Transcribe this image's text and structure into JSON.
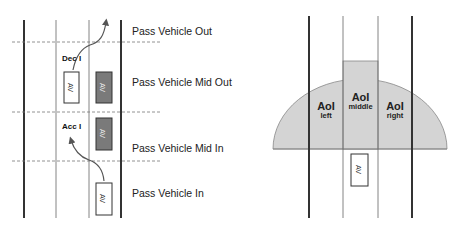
{
  "left_diagram": {
    "zone_labels": [
      "Pass Vehicle Out",
      "Pass Vehicle Mid Out",
      "Pass Vehicle Mid In",
      "Pass Vehicle In"
    ],
    "maneuvers": {
      "decel": "Dec I",
      "accel": "Acc I"
    },
    "vehicles": [
      {
        "label": "AV",
        "style": "white"
      },
      {
        "label": "AV",
        "style": "gray"
      },
      {
        "label": "AV",
        "style": "gray"
      },
      {
        "label": "AV",
        "style": "white"
      }
    ]
  },
  "right_diagram": {
    "aoi": [
      {
        "title": "AoI",
        "sub": "left"
      },
      {
        "title": "AoI",
        "sub": "middle"
      },
      {
        "title": "AoI",
        "sub": "right"
      }
    ],
    "vehicle": {
      "label": "AV"
    }
  },
  "colors": {
    "aoi_fill": "#d4d4d4",
    "gray_vehicle": "#7a7a7a",
    "lane_line": "#333333"
  }
}
